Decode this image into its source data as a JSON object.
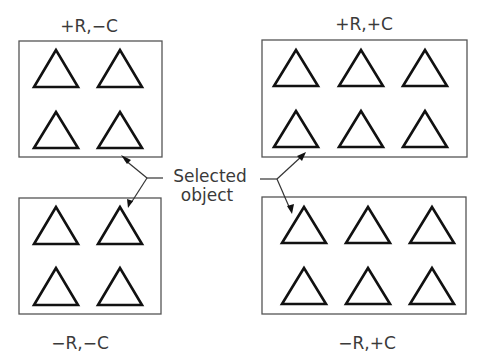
{
  "diagram": {
    "type": "quadrant-array-diagram",
    "callout": {
      "line1": "Selected",
      "line2": "object"
    },
    "quadrants": [
      {
        "id": "top-left",
        "label": "+R,−C",
        "rows": 2,
        "cols": 2
      },
      {
        "id": "top-right",
        "label": "+R,+C",
        "rows": 2,
        "cols": 3
      },
      {
        "id": "bottom-left",
        "label": "−R,−C",
        "rows": 2,
        "cols": 2
      },
      {
        "id": "bottom-right",
        "label": "−R,+C",
        "rows": 2,
        "cols": 3
      }
    ],
    "object_shape": "triangle",
    "colors": {
      "background": "#ffffff",
      "box_stroke": "#555555",
      "object_stroke": "#111111",
      "text": "#3a3a3a"
    }
  }
}
